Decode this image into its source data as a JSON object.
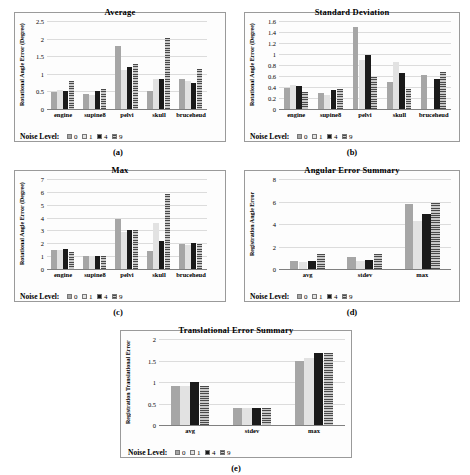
{
  "figure": {
    "background": "#ffffff",
    "legend_title": "Noise Level:",
    "series": [
      {
        "name": "0",
        "color": "#a6a6a6",
        "pattern": "solid-gray"
      },
      {
        "name": "1",
        "color": "#e2e2e2",
        "pattern": "solid-light"
      },
      {
        "name": "4",
        "color": "#1a1a1a",
        "pattern": "solid-black"
      },
      {
        "name": "9",
        "color": "#9c9c9c",
        "pattern": "horizontal-hatch"
      }
    ]
  },
  "panels": [
    {
      "caption": "(a)",
      "chart_data": {
        "type": "bar",
        "title": "Average",
        "xlabel": "",
        "ylabel": "Rotational Angle Error (Degree)",
        "categories": [
          "engine",
          "supine8",
          "pelvi",
          "skull",
          "bruceheud"
        ],
        "ylim": [
          0,
          2.5
        ],
        "yticks": [
          "0",
          "0.5",
          "1",
          "1.5",
          "2",
          "2.5"
        ],
        "grid": true,
        "legend_position": "below",
        "series": [
          {
            "name": "0",
            "values": [
              0.47,
              0.43,
              1.8,
              0.52,
              0.84
            ]
          },
          {
            "name": "1",
            "values": [
              0.55,
              0.41,
              1.1,
              0.86,
              0.79
            ]
          },
          {
            "name": "4",
            "values": [
              0.5,
              0.5,
              1.19,
              0.86,
              0.73
            ]
          },
          {
            "name": "9",
            "values": [
              0.8,
              0.58,
              1.29,
              2.02,
              1.15
            ]
          }
        ]
      }
    },
    {
      "caption": "(b)",
      "chart_data": {
        "type": "bar",
        "title": "Standard Deviation",
        "xlabel": "",
        "ylabel": "Rotational Angle Error (Degree)",
        "categories": [
          "engine",
          "supine8",
          "pelvi",
          "skull",
          "bruceheud"
        ],
        "ylim": [
          0,
          1.6
        ],
        "yticks": [
          "0",
          "0.2",
          "0.4",
          "0.6",
          "0.8",
          "1",
          "1.2",
          "1.4",
          "1.6"
        ],
        "grid": true,
        "legend_position": "below",
        "series": [
          {
            "name": "0",
            "values": [
              0.39,
              0.29,
              1.5,
              0.49,
              0.62
            ]
          },
          {
            "name": "1",
            "values": [
              0.44,
              0.26,
              0.89,
              0.86,
              0.0
            ]
          },
          {
            "name": "4",
            "values": [
              0.41,
              0.34,
              0.99,
              0.66,
              0.54
            ]
          },
          {
            "name": "9",
            "values": [
              0.31,
              0.37,
              0.59,
              0.37,
              0.67
            ]
          }
        ]
      }
    },
    {
      "caption": "(c)",
      "chart_data": {
        "type": "bar",
        "title": "Max",
        "xlabel": "",
        "ylabel": "Rotational Angle Error (Degree)",
        "categories": [
          "engine",
          "supine8",
          "pelvi",
          "skull",
          "bruceheud"
        ],
        "ylim": [
          0,
          7
        ],
        "yticks": [
          "0",
          "1",
          "2",
          "3",
          "4",
          "5",
          "6",
          "7"
        ],
        "grid": true,
        "legend_position": "below",
        "series": [
          {
            "name": "0",
            "values": [
              1.45,
              1.05,
              3.92,
              1.42,
              1.97
            ]
          },
          {
            "name": "1",
            "values": [
              1.45,
              1.02,
              2.88,
              3.55,
              1.9
            ]
          },
          {
            "name": "4",
            "values": [
              1.52,
              1.0,
              3.05,
              2.15,
              2.03
            ]
          },
          {
            "name": "9",
            "values": [
              1.29,
              1.02,
              3.05,
              5.85,
              1.93
            ]
          }
        ]
      }
    },
    {
      "caption": "(d)",
      "chart_data": {
        "type": "bar",
        "title": "Angular Error Summary",
        "xlabel": "",
        "ylabel": "Registration Angle Error",
        "categories": [
          "avg",
          "stdev",
          "max"
        ],
        "ylim": [
          0,
          8
        ],
        "yticks": [
          "0",
          "2",
          "4",
          "6",
          "8"
        ],
        "grid": true,
        "legend_position": "below",
        "series": [
          {
            "name": "0",
            "values": [
              0.68,
              1.08,
              5.78
            ]
          },
          {
            "name": "1",
            "values": [
              0.64,
              0.68,
              4.25
            ]
          },
          {
            "name": "4",
            "values": [
              0.7,
              0.81,
              4.88
            ]
          },
          {
            "name": "9",
            "values": [
              1.3,
              1.36,
              5.85
            ]
          }
        ]
      }
    },
    {
      "caption": "(e)",
      "chart_data": {
        "type": "bar",
        "title": "Translational Error Summary",
        "xlabel": "",
        "ylabel": "Registration Translational Error",
        "categories": [
          "avg",
          "stdev",
          "max"
        ],
        "ylim": [
          0,
          2
        ],
        "yticks": [
          "0",
          "0.5",
          "1",
          "1.5",
          "2"
        ],
        "grid": true,
        "legend_position": "below",
        "series": [
          {
            "name": "0",
            "values": [
              0.9,
              0.39,
              1.49
            ]
          },
          {
            "name": "1",
            "values": [
              0.9,
              0.39,
              1.57
            ]
          },
          {
            "name": "4",
            "values": [
              0.99,
              0.39,
              1.68
            ]
          },
          {
            "name": "9",
            "values": [
              0.9,
              0.39,
              1.68
            ]
          }
        ]
      }
    }
  ]
}
